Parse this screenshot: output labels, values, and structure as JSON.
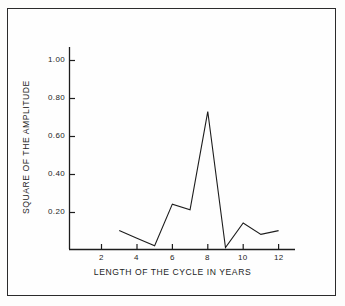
{
  "figure": {
    "background_color": "#fdfdfc",
    "frame_color": "#2b2b2b",
    "line_color": "#1d1d1d"
  },
  "chart_data": {
    "type": "line",
    "title": "",
    "xlabel": "LENGTH OF THE CYCLE IN YEARS",
    "ylabel": "SQUARE OF THE AMPLITUDE",
    "xlim": [
      1,
      13
    ],
    "ylim": [
      0,
      1.1
    ],
    "grid": false,
    "legend": null,
    "x": [
      3,
      4,
      5,
      6,
      7,
      8,
      9,
      10,
      11,
      12
    ],
    "values": [
      0.1,
      0.06,
      0.02,
      0.24,
      0.21,
      0.73,
      0.01,
      0.14,
      0.08,
      0.1
    ],
    "xticks": [
      2,
      4,
      6,
      8,
      10,
      12
    ],
    "xtick_labels": [
      "2",
      "4",
      "6",
      "8",
      "10",
      "12"
    ],
    "yticks": [
      0.2,
      0.4,
      0.6,
      0.8,
      1.0
    ],
    "ytick_labels": [
      "0.20",
      "0.40",
      "0.60",
      "0.80",
      "1.00"
    ]
  },
  "axes": {
    "x_axis_name": "length-of-cycle-axis",
    "y_axis_name": "square-of-amplitude-axis"
  }
}
